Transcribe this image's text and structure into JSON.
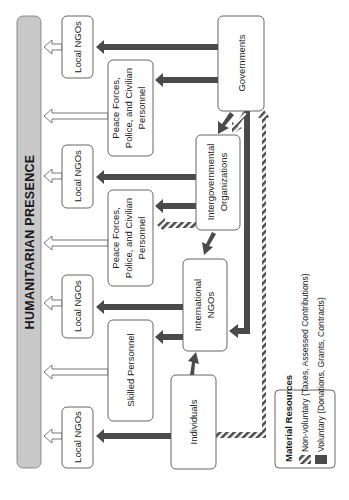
{
  "diagram": {
    "orientation": "rotated 90 degrees counter-clockwise",
    "title": "HUMANITARIAN PRESENCE",
    "nodes": {
      "local_ngos_1": "Local NGOs",
      "local_ngos_2": "Local NGOs",
      "local_ngos_3": "Local NGOs",
      "local_ngos_4": "Local NGOs",
      "peace_forces_1": [
        "Peace Forces,",
        "Police, and Civilian",
        "Personnel"
      ],
      "peace_forces_2": [
        "Peace Forces,",
        "Police, and Civilian",
        "Personnel"
      ],
      "skilled_personnel": "Skilled Personnel",
      "governments": "Governments",
      "intergovernmental": [
        "Intergovernmental",
        "Organizations"
      ],
      "international_ngos": [
        "International",
        "NGOs"
      ],
      "individuals": "Individuals"
    },
    "legend": {
      "title": "Material Resources",
      "items": [
        {
          "label": "Non-voluntary (Taxes, Assessed Contributions)",
          "style": "hatched"
        },
        {
          "label": "Voluntary (Donations, Grants, Contracts)",
          "style": "solid"
        }
      ]
    },
    "colors": {
      "presence_bar": "#c8c8c8",
      "voluntary_arrow": "#4a4a4a",
      "hatch_dark": "#4a4a4a",
      "hatch_light": "#ffffff",
      "box_stroke": "#555555"
    }
  }
}
